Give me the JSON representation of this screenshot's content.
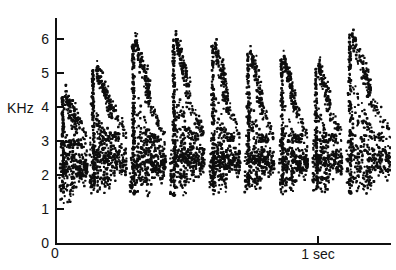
{
  "figure": {
    "kind": "spectrogram-scatter",
    "y_axis_label": "KHz",
    "x_tick_origin_label": "0",
    "x_tick_one_sec_label": "1 sec"
  },
  "chart_data": {
    "type": "scatter",
    "title": "",
    "xlabel": "",
    "ylabel": "KHz",
    "xlim": [
      0,
      1.32
    ],
    "ylim": [
      0,
      6.7
    ],
    "grid": false,
    "legend": null,
    "y_ticks": [
      0,
      1,
      2,
      3,
      4,
      5,
      6
    ],
    "y_tick_labels": [
      "0",
      "1",
      "2",
      "3",
      "4",
      "5",
      "6"
    ],
    "x_ticks": [
      0,
      1
    ],
    "x_tick_labels": [
      "0",
      "1 sec"
    ],
    "x_units": "sec",
    "y_units": "KHz",
    "point_count_estimate": 2100,
    "syllables": [
      {
        "index": 1,
        "t_start": 0.005,
        "t_end": 0.115,
        "f_low": 1.15,
        "f_high": 4.3,
        "onset_t": 0.03,
        "peak_f": 4.3,
        "band_center": 2.25,
        "band_spread": 0.85,
        "density": 1.0
      },
      {
        "index": 2,
        "t_start": 0.12,
        "t_end": 0.265,
        "f_low": 1.45,
        "f_high": 5.1,
        "onset_t": 0.15,
        "peak_f": 5.1,
        "band_center": 2.45,
        "band_spread": 0.95,
        "density": 1.25
      },
      {
        "index": 3,
        "t_start": 0.275,
        "t_end": 0.415,
        "f_low": 1.3,
        "f_high": 5.9,
        "onset_t": 0.3,
        "peak_f": 5.9,
        "band_center": 2.4,
        "band_spread": 0.95,
        "density": 1.35
      },
      {
        "index": 4,
        "t_start": 0.43,
        "t_end": 0.565,
        "f_low": 1.35,
        "f_high": 6.0,
        "onset_t": 0.455,
        "peak_f": 6.0,
        "band_center": 2.45,
        "band_spread": 0.9,
        "density": 1.3
      },
      {
        "index": 5,
        "t_start": 0.58,
        "t_end": 0.7,
        "f_low": 1.4,
        "f_high": 5.8,
        "onset_t": 0.605,
        "peak_f": 5.8,
        "band_center": 2.45,
        "band_spread": 0.85,
        "density": 1.15
      },
      {
        "index": 6,
        "t_start": 0.715,
        "t_end": 0.83,
        "f_low": 1.45,
        "f_high": 5.6,
        "onset_t": 0.74,
        "peak_f": 5.6,
        "band_center": 2.4,
        "band_spread": 0.8,
        "density": 1.05
      },
      {
        "index": 7,
        "t_start": 0.845,
        "t_end": 0.96,
        "f_low": 1.4,
        "f_high": 5.4,
        "onset_t": 0.868,
        "peak_f": 5.4,
        "band_center": 2.4,
        "band_spread": 0.8,
        "density": 1.0
      },
      {
        "index": 8,
        "t_start": 0.975,
        "t_end": 1.09,
        "f_low": 1.45,
        "f_high": 5.3,
        "onset_t": 1.0,
        "peak_f": 5.3,
        "band_center": 2.4,
        "band_spread": 0.8,
        "density": 1.0
      },
      {
        "index": 9,
        "t_start": 1.105,
        "t_end": 1.285,
        "f_low": 1.4,
        "f_high": 6.1,
        "onset_t": 1.13,
        "peak_f": 6.1,
        "band_center": 2.45,
        "band_spread": 0.9,
        "density": 1.25
      }
    ]
  }
}
